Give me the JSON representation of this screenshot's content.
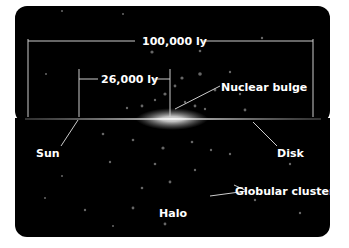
{
  "diagram": {
    "labels": {
      "total_diameter": "100,000 ly",
      "sun_distance": "26,000 ly",
      "nuclear_bulge": "Nuclear bulge",
      "sun": "Sun",
      "disk": "Disk",
      "globular_clusters": "Globular clusters",
      "halo": "Halo"
    },
    "colors": {
      "background": "#000000",
      "text": "#ffffff",
      "lines": "#cccccc",
      "page": "#ffffff"
    }
  }
}
